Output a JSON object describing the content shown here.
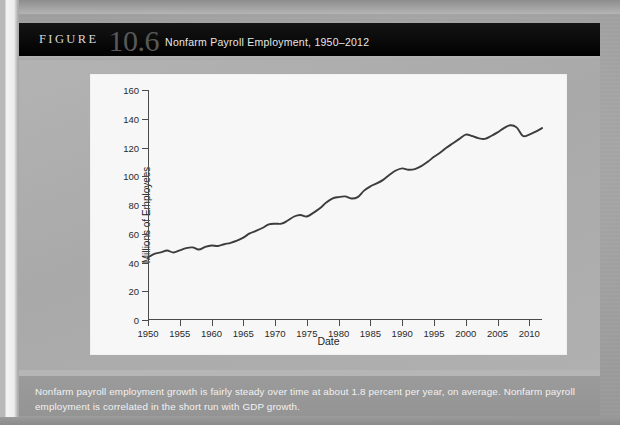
{
  "figure": {
    "label": "FIGURE",
    "number": "10.6",
    "title": "Nonfarm Payroll Employment, 1950–2012",
    "note": "Nonfarm payroll employment growth is fairly steady over time at about 1.8 percent per year, on average. Nonfarm payroll employment is correlated in the short run with GDP growth."
  },
  "colors": {
    "header_bg": "#000000",
    "figure_number": "#585858",
    "panel_bg": "#ada d ad",
    "plot_bg": "#f7f7f7",
    "line": "#3c3c3c",
    "axis": "#4a4a4a",
    "note_bg": "#979797"
  },
  "chart_data": {
    "type": "line",
    "title": "Nonfarm Payroll Employment, 1950–2012",
    "xlabel": "Date",
    "ylabel": "Millions of Employees",
    "xlim": [
      1950,
      2012
    ],
    "ylim": [
      0,
      160
    ],
    "ytick_labels": [
      "0",
      "20",
      "40",
      "60",
      "80",
      "100",
      "120",
      "140",
      "160"
    ],
    "yticks": [
      0,
      20,
      40,
      60,
      80,
      100,
      120,
      140,
      160
    ],
    "xtick_labels": [
      "1950",
      "1955",
      "1960",
      "1965",
      "1970",
      "1975",
      "1980",
      "1985",
      "1990",
      "1995",
      "2000",
      "2005",
      "2010"
    ],
    "xticks": [
      1950,
      1955,
      1960,
      1965,
      1970,
      1975,
      1980,
      1985,
      1990,
      1995,
      2000,
      2005,
      2010
    ],
    "grid": false,
    "legend": null,
    "series": [
      {
        "name": "Nonfarm payroll employment",
        "units": "millions of employees",
        "x": [
          1950,
          1951,
          1952,
          1953,
          1954,
          1955,
          1956,
          1957,
          1958,
          1959,
          1960,
          1961,
          1962,
          1963,
          1964,
          1965,
          1966,
          1967,
          1968,
          1969,
          1970,
          1971,
          1972,
          1973,
          1974,
          1975,
          1976,
          1977,
          1978,
          1979,
          1980,
          1981,
          1982,
          1983,
          1984,
          1985,
          1986,
          1987,
          1988,
          1989,
          1990,
          1991,
          1992,
          1993,
          1994,
          1995,
          1996,
          1997,
          1998,
          1999,
          2000,
          2001,
          2002,
          2003,
          2004,
          2005,
          2006,
          2007,
          2008,
          2009,
          2010,
          2011,
          2012
        ],
        "values": [
          43.5,
          46.0,
          47.0,
          48.3,
          47.0,
          48.5,
          50.0,
          50.5,
          49.0,
          50.8,
          51.8,
          51.5,
          52.7,
          53.7,
          55.2,
          57.3,
          60.2,
          62.0,
          64.0,
          66.5,
          67.0,
          67.0,
          69.2,
          72.0,
          73.0,
          72.0,
          74.5,
          77.5,
          81.5,
          84.5,
          85.5,
          86.0,
          84.5,
          85.5,
          90.0,
          93.0,
          95.0,
          97.5,
          101.0,
          104.0,
          105.5,
          104.5,
          105.0,
          107.0,
          110.0,
          113.5,
          116.5,
          120.0,
          123.0,
          126.0,
          129.0,
          128.0,
          126.5,
          126.0,
          128.0,
          130.5,
          133.5,
          135.5,
          134.0,
          128.0,
          129.0,
          131.0,
          133.5
        ]
      }
    ]
  }
}
